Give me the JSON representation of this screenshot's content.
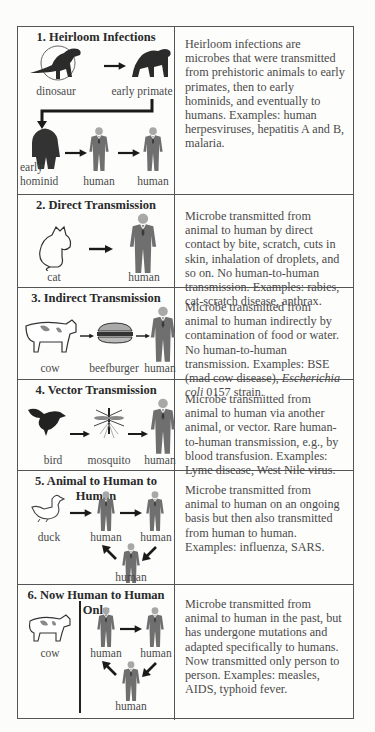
{
  "rows": [
    {
      "title": "1. Heirloom Infections",
      "labels": {
        "a": "dinosaur",
        "b": "early primate",
        "c1": "early",
        "c2": "hominid",
        "d": "human",
        "e": "human"
      },
      "description": "Heirloom infections are microbes that were transmitted from prehistoric animals to early primates, then to early hominids, and eventually to humans. Examples: human herpesviruses, hepatitis A and B, malaria."
    },
    {
      "title": "2. Direct Transmission",
      "labels": {
        "a": "cat",
        "b": "human"
      },
      "description": "Microbe transmitted from animal to human by direct contact by bite, scratch, cuts in skin, inhalation of droplets, and so on. No human-to-human transmission. Examples: rabies, cat-scratch disease, anthrax."
    },
    {
      "title": "3. Indirect Transmission",
      "labels": {
        "a": "cow",
        "b": "beefburger",
        "c": "human"
      },
      "description_pre": "Microbe transmitted from animal to human indirectly by contamination of food or water. No human-to-human transmission. Examples: BSE (mad cow disease), ",
      "description_em": "Escherichia coli",
      "description_post": " 0157 strain."
    },
    {
      "title": "4. Vector Transmission",
      "labels": {
        "a": "bird",
        "b": "mosquito",
        "c": "human"
      },
      "description": "Microbe transmitted from animal to human via another animal, or vector. Rare human-to-human transmission, e.g., by blood transfusion. Examples: Lyme disease, West Nile virus."
    },
    {
      "title": "5. Animal to Human to Human",
      "labels": {
        "a": "duck",
        "b": "human",
        "c": "human",
        "d": "human"
      },
      "description": "Microbe transmitted from animal to human on an ongoing basis but then also transmitted from human to human. Examples: influenza, SARS."
    },
    {
      "title": "6. Now Human to Human Only",
      "labels": {
        "a": "cow",
        "b": "human",
        "c": "human",
        "d": "human"
      },
      "description": "Microbe transmitted from animal to human in the past, but has undergone mutations and adapted specifically to humans. Now transmitted only person to person. Examples: measles, AIDS, typhoid fever."
    }
  ],
  "colors": {
    "border": "#555555",
    "human_body": "#6f6f6f",
    "human_head": "#a9a9a9",
    "arrow": "#1a1a1a",
    "silhouette": "#2b2b2b"
  }
}
